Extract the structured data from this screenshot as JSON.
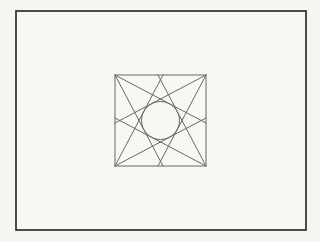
{
  "canvas": {
    "width": 320,
    "height": 242,
    "background": "#f6f5f2"
  },
  "drawing": {
    "outer_border": {
      "x": 16,
      "y": 11,
      "width": 290,
      "height": 219,
      "stroke": "#2e2e2e",
      "stroke_width": 1.7,
      "fill": "#f8f7f4"
    },
    "square": {
      "x": 115,
      "y": 75,
      "width": 91,
      "height": 91,
      "stroke": "#686868",
      "stroke_width": 1,
      "fill": "none"
    },
    "circle": {
      "cx": 160.5,
      "cy": 120.5,
      "r": 19,
      "stroke": "#686868",
      "stroke_width": 1,
      "fill": "none"
    },
    "chords": [
      {
        "name": "chord-top-left-steep",
        "x1": 115,
        "y1": 75,
        "x2": 163,
        "y2": 166
      },
      {
        "name": "chord-top-left-shallow",
        "x1": 115,
        "y1": 75,
        "x2": 206,
        "y2": 123
      },
      {
        "name": "chord-top-right-steep",
        "x1": 206,
        "y1": 75,
        "x2": 158,
        "y2": 166
      },
      {
        "name": "chord-top-right-shallow",
        "x1": 206,
        "y1": 75,
        "x2": 115,
        "y2": 123
      },
      {
        "name": "chord-bottom-right-steep",
        "x1": 206,
        "y1": 166,
        "x2": 158,
        "y2": 75
      },
      {
        "name": "chord-bottom-right-shallow",
        "x1": 206,
        "y1": 166,
        "x2": 115,
        "y2": 118
      },
      {
        "name": "chord-bottom-left-steep",
        "x1": 115,
        "y1": 166,
        "x2": 163,
        "y2": 75
      },
      {
        "name": "chord-bottom-left-shallow",
        "x1": 115,
        "y1": 166,
        "x2": 206,
        "y2": 118
      }
    ],
    "line_color": "#686868",
    "line_width": 1
  }
}
